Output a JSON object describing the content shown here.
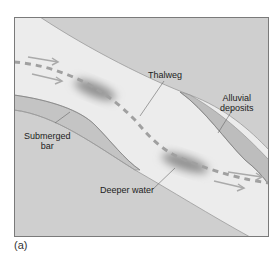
{
  "figure": {
    "caption": "(a)",
    "colors": {
      "bank": "#cfcfcf",
      "channel": "#ececec",
      "frame": "#7a7a7a",
      "deposit": "#b7b7b7",
      "deeper_water": "#8f8f8f",
      "thalweg_line": "#a3a3a3",
      "arrow": "#b0b0b0"
    },
    "labels": {
      "thalweg": "Thalweg",
      "alluvial_line1": "Alluvial",
      "alluvial_line2": "deposits",
      "submerged_line1": "Submerged",
      "submerged_line2": "bar",
      "deeper_water": "Deeper water"
    }
  }
}
